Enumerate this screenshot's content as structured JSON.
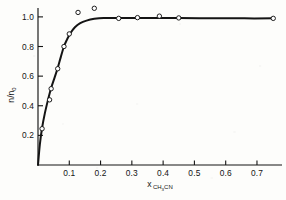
{
  "figure": {
    "background_color": "#fdfdfb",
    "ink_color": "#141414"
  },
  "axis_titles": {
    "y_numerator": "n",
    "y_slash": "/",
    "y_denominator": "n",
    "y_denominator_sub": "0",
    "y_full": "n/n0",
    "x_symbol": "x",
    "x_sub_c": "CH",
    "x_sub_3": "3",
    "x_sub_cn": "CN",
    "x_full": "x CH3CN"
  },
  "ticks": {
    "x_labels": [
      "0.1",
      "0.2",
      "0.3",
      "0.4",
      "0.5",
      "0.6",
      "0.7"
    ],
    "x_values": [
      0.1,
      0.2,
      0.3,
      0.4,
      0.5,
      0.6,
      0.7
    ],
    "y_labels": [
      "0.2",
      "0.4",
      "0.6",
      "0.8",
      "1.0"
    ],
    "y_values": [
      0.2,
      0.4,
      0.6,
      0.8,
      1.0
    ]
  },
  "chart_data": {
    "type": "scatter",
    "title": "",
    "subtitle": "",
    "xlabel": "x CH3CN",
    "ylabel": "n/n0",
    "xlim": [
      0.0,
      0.78
    ],
    "ylim": [
      0.0,
      1.06
    ],
    "grid": false,
    "legend": null,
    "legend_position": "none",
    "marker_style": "open-circle",
    "marker_edge_color": "#141414",
    "marker_fill_color": "#ffffff",
    "curve_color": "#141414",
    "series": [
      {
        "name": "measured points",
        "marker": "open-circle",
        "points": [
          {
            "x": 0.013,
            "y": 0.245
          },
          {
            "x": 0.037,
            "y": 0.44
          },
          {
            "x": 0.042,
            "y": 0.515
          },
          {
            "x": 0.063,
            "y": 0.65
          },
          {
            "x": 0.083,
            "y": 0.8
          },
          {
            "x": 0.1,
            "y": 0.885
          },
          {
            "x": 0.128,
            "y": 1.03
          },
          {
            "x": 0.18,
            "y": 1.058
          },
          {
            "x": 0.258,
            "y": 0.99
          },
          {
            "x": 0.318,
            "y": 0.995
          },
          {
            "x": 0.388,
            "y": 1.005
          },
          {
            "x": 0.45,
            "y": 0.993
          },
          {
            "x": 0.752,
            "y": 0.99
          }
        ]
      },
      {
        "name": "fitted curve",
        "marker": "none",
        "line": true,
        "points": [
          {
            "x": 0.0,
            "y": 0.0
          },
          {
            "x": 0.006,
            "y": 0.14
          },
          {
            "x": 0.013,
            "y": 0.25
          },
          {
            "x": 0.022,
            "y": 0.35
          },
          {
            "x": 0.032,
            "y": 0.44
          },
          {
            "x": 0.042,
            "y": 0.52
          },
          {
            "x": 0.053,
            "y": 0.59
          },
          {
            "x": 0.063,
            "y": 0.655
          },
          {
            "x": 0.073,
            "y": 0.73
          },
          {
            "x": 0.083,
            "y": 0.8
          },
          {
            "x": 0.093,
            "y": 0.848
          },
          {
            "x": 0.103,
            "y": 0.888
          },
          {
            "x": 0.118,
            "y": 0.93
          },
          {
            "x": 0.135,
            "y": 0.958
          },
          {
            "x": 0.155,
            "y": 0.975
          },
          {
            "x": 0.18,
            "y": 0.987
          },
          {
            "x": 0.21,
            "y": 0.993
          },
          {
            "x": 0.258,
            "y": 0.992
          },
          {
            "x": 0.318,
            "y": 0.992
          },
          {
            "x": 0.388,
            "y": 0.993
          },
          {
            "x": 0.45,
            "y": 0.992
          },
          {
            "x": 0.56,
            "y": 0.991
          },
          {
            "x": 0.66,
            "y": 0.99
          },
          {
            "x": 0.752,
            "y": 0.99
          }
        ]
      }
    ]
  }
}
